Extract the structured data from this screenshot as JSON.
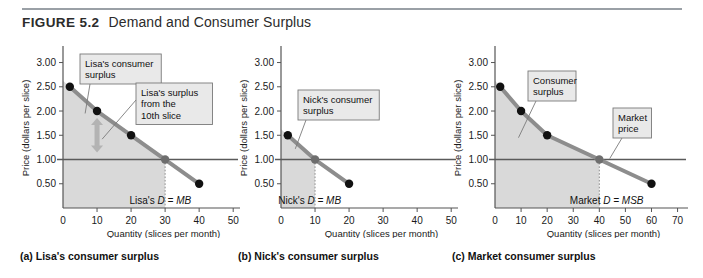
{
  "figure": {
    "number": "FIGURE 5.2",
    "title": "Demand and Consumer Surplus"
  },
  "panels": [
    {
      "key": "a",
      "caption": "(a) Lisa's consumer surplus",
      "curve_label_plain": "Lisa's ",
      "curve_label_italic": "D = MB",
      "callouts": [
        {
          "name": "consumer-surplus",
          "lines": [
            "Lisa's consumer",
            "surplus"
          ]
        },
        {
          "name": "tenth-slice-surplus",
          "lines": [
            "Lisa's surplus",
            "from the",
            "10th slice"
          ]
        }
      ]
    },
    {
      "key": "b",
      "caption": "(b) Nick's consumer surplus",
      "curve_label_plain": "Nick's ",
      "curve_label_italic": "D = MB",
      "callouts": [
        {
          "name": "consumer-surplus",
          "lines": [
            "Nick's consumer",
            "surplus"
          ]
        }
      ]
    },
    {
      "key": "c",
      "caption": "(c) Market consumer surplus",
      "curve_label_plain": "Market ",
      "curve_label_italic": "D = MSB",
      "callouts": [
        {
          "name": "consumer-surplus",
          "lines": [
            "Consumer",
            "surplus"
          ]
        },
        {
          "name": "market-price",
          "lines": [
            "Market",
            "price"
          ]
        }
      ]
    }
  ],
  "chart_data": [
    {
      "type": "line",
      "panel": "a",
      "title": "Lisa's consumer surplus",
      "xlabel": "Quantity (slices per month)",
      "ylabel": "Price (dollars per slice)",
      "xlim": [
        0,
        52
      ],
      "ylim": [
        0,
        3.3
      ],
      "xticks": [
        0,
        10,
        20,
        30,
        40,
        50
      ],
      "xticklabels": [
        "0",
        "10",
        "20",
        "30",
        "40",
        "50"
      ],
      "yticks": [
        0.5,
        1.0,
        1.5,
        2.0,
        2.5,
        3.0
      ],
      "yticklabels": [
        "0.50",
        "1.00",
        "1.50",
        "2.00",
        "2.50",
        "3.00"
      ],
      "grid": false,
      "series": [
        {
          "name": "Lisa's D = MB",
          "x": [
            2,
            10,
            20,
            30,
            40
          ],
          "y": [
            2.5,
            2.0,
            1.5,
            1.0,
            0.5
          ],
          "marker": "filled-circle",
          "color": "#8d8d8d"
        }
      ],
      "market_price": 1.0,
      "quantity_at_price": 30,
      "surplus_region": "area between demand curve and $1.00 price line from Q=0 to Q=30",
      "annotations": [
        {
          "label": "market price line",
          "value": 1.0
        },
        {
          "label": "surplus from 10th slice",
          "from": 1.0,
          "to": 2.0,
          "at_quantity": 10
        }
      ]
    },
    {
      "type": "line",
      "panel": "b",
      "title": "Nick's consumer surplus",
      "xlabel": "Quantity (slices per month)",
      "ylabel": "Price (dollars per slice)",
      "xlim": [
        0,
        52
      ],
      "ylim": [
        0,
        3.3
      ],
      "xticks": [
        0,
        10,
        20,
        30,
        40,
        50
      ],
      "xticklabels": [
        "0",
        "10",
        "20",
        "30",
        "40",
        "50"
      ],
      "yticks": [
        0.5,
        1.0,
        1.5,
        2.0,
        2.5,
        3.0
      ],
      "yticklabels": [
        "0.50",
        "1.00",
        "1.50",
        "2.00",
        "2.50",
        "3.00"
      ],
      "grid": false,
      "series": [
        {
          "name": "Nick's D = MB",
          "x": [
            2,
            10,
            20
          ],
          "y": [
            1.5,
            1.0,
            0.5
          ],
          "marker": "filled-circle",
          "color": "#8d8d8d"
        }
      ],
      "market_price": 1.0,
      "quantity_at_price": 10,
      "surplus_region": "area between demand curve and $1.00 price line from Q=0 to Q=10",
      "annotations": [
        {
          "label": "market price line",
          "value": 1.0
        }
      ]
    },
    {
      "type": "line",
      "panel": "c",
      "title": "Market consumer surplus",
      "xlabel": "Quantity (slices per month)",
      "ylabel": "Price (dollars per slice)",
      "xlim": [
        0,
        74
      ],
      "ylim": [
        0,
        3.3
      ],
      "xticks": [
        0,
        10,
        20,
        30,
        40,
        50,
        60,
        70
      ],
      "xticklabels": [
        "0",
        "10",
        "20",
        "30",
        "40",
        "50",
        "60",
        "70"
      ],
      "yticks": [
        0.5,
        1.0,
        1.5,
        2.0,
        2.5,
        3.0
      ],
      "yticklabels": [
        "0.50",
        "1.00",
        "1.50",
        "2.00",
        "2.50",
        "3.00"
      ],
      "grid": false,
      "series": [
        {
          "name": "Market D = MSB",
          "x": [
            2,
            10,
            20,
            40,
            60
          ],
          "y": [
            2.5,
            2.0,
            1.5,
            1.0,
            0.5
          ],
          "marker": "filled-circle",
          "color": "#8d8d8d"
        }
      ],
      "market_price": 1.0,
      "quantity_at_price": 40,
      "surplus_region": "area between demand curve and $1.00 price line from Q=0 to Q=40",
      "annotations": [
        {
          "label": "market price line",
          "value": 1.0
        }
      ]
    }
  ]
}
